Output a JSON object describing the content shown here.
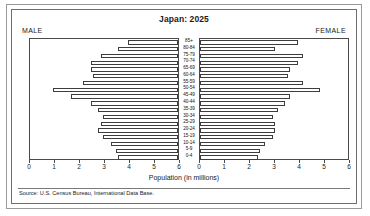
{
  "chart_data": {
    "type": "bar",
    "subtype": "population-pyramid",
    "title": "Japan: 2025",
    "xlabel": "Population (in millions)",
    "ylabel": "",
    "source": "Source: U.S. Census Bureau, International Data Base.",
    "left_panel_label": "MALE",
    "right_panel_label": "FEMALE",
    "xlim": [
      0,
      6
    ],
    "grid": false,
    "legend": "none",
    "male_tick_labels": [
      "6",
      "5",
      "4",
      "3",
      "2",
      "1",
      "0"
    ],
    "female_tick_labels": [
      "0",
      "1",
      "2",
      "3",
      "4",
      "5",
      "6"
    ],
    "tick_values": [
      0,
      1,
      2,
      3,
      4,
      5,
      6
    ],
    "categories": [
      "85+",
      "80-84",
      "75-79",
      "70-74",
      "65-69",
      "60-64",
      "55-59",
      "50-54",
      "45-49",
      "40-44",
      "35-39",
      "30-34",
      "25-29",
      "20-24",
      "15-19",
      "10-14",
      "5-9",
      "0-4"
    ],
    "series": [
      {
        "name": "MALE",
        "side": "left",
        "units": "millions",
        "values": [
          2.0,
          2.4,
          3.1,
          3.5,
          3.5,
          3.4,
          3.8,
          5.0,
          4.3,
          3.5,
          3.2,
          3.0,
          3.1,
          3.2,
          3.0,
          2.7,
          2.5,
          2.4
        ]
      },
      {
        "name": "FEMALE",
        "side": "right",
        "units": "millions",
        "values": [
          3.9,
          3.0,
          4.1,
          3.9,
          3.6,
          3.5,
          4.1,
          4.8,
          3.6,
          3.4,
          3.1,
          2.9,
          3.0,
          3.0,
          2.9,
          2.6,
          2.4,
          2.3
        ]
      }
    ]
  }
}
